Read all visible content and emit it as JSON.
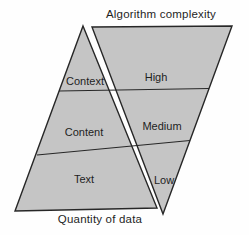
{
  "diagram": {
    "top_label": "Algorithm complexity",
    "bottom_label": "Quantity of data",
    "left_pyramid": {
      "title": "Quantity of data",
      "levels": [
        "Context",
        "Content",
        "Text"
      ]
    },
    "right_pyramid": {
      "title": "Algorithm complexity",
      "levels": [
        "High",
        "Medium",
        "Low"
      ]
    },
    "colors": {
      "shape_fill": "#c5c5c5",
      "line": "#272727",
      "text": "#1e1e1e",
      "background": "#fefefe"
    }
  }
}
